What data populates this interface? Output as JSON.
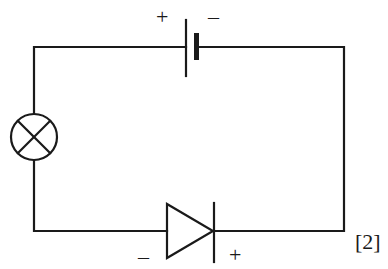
{
  "diagram": {
    "type": "circuit",
    "components": [
      {
        "id": "battery",
        "kind": "cell",
        "positive_label": "+",
        "negative_label": "–"
      },
      {
        "id": "lamp",
        "kind": "filament-lamp"
      },
      {
        "id": "diode",
        "kind": "diode",
        "negative_label": "–",
        "positive_label": "+"
      }
    ],
    "marks": "[2]",
    "colors": {
      "stroke": "#1a1a1a",
      "background": "#ffffff"
    }
  }
}
